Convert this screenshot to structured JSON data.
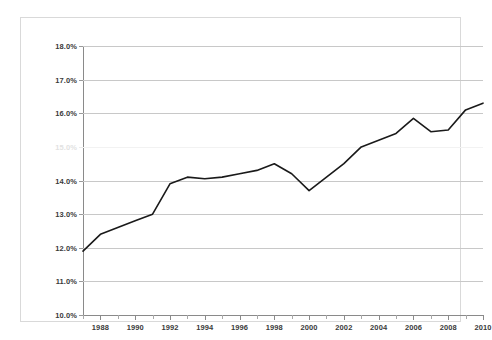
{
  "chart_data": {
    "type": "line",
    "title": "",
    "subtitle": "",
    "xlabel": "",
    "ylabel": "",
    "xlim": [
      1987,
      2010
    ],
    "ylim": [
      10.0,
      18.0
    ],
    "grid": true,
    "legend": false,
    "legend_position": "none",
    "y_tick_labels": [
      "18.0%",
      "17.0%",
      "16.0%",
      "15.0%",
      "14.0%",
      "13.0%",
      "12.0%",
      "11.0%",
      "10.0%"
    ],
    "y_ticks": [
      18.0,
      17.0,
      16.0,
      15.0,
      14.0,
      13.0,
      12.0,
      11.0,
      10.0
    ],
    "y_tick_faded": [
      false,
      false,
      false,
      true,
      false,
      false,
      false,
      false,
      false
    ],
    "x_tick_labels": [
      "1988",
      "1990",
      "1992",
      "1994",
      "1996",
      "1998",
      "2000",
      "2002",
      "2004",
      "2006",
      "2008",
      "2010"
    ],
    "x_ticks_major": [
      1988,
      1990,
      1992,
      1994,
      1996,
      1998,
      2000,
      2002,
      2004,
      2006,
      2008,
      2010
    ],
    "x_ticks_minor": [
      1987,
      1989,
      1991,
      1993,
      1995,
      1997,
      1999,
      2001,
      2003,
      2005,
      2007,
      2009
    ],
    "series": [
      {
        "name": "",
        "color": "#1a1a1a",
        "x": [
          1987,
          1988,
          1989,
          1990,
          1991,
          1992,
          1993,
          1994,
          1995,
          1996,
          1997,
          1998,
          1999,
          2000,
          2001,
          2002,
          2003,
          2004,
          2005,
          2006,
          2007,
          2008,
          2009,
          2010
        ],
        "values": [
          11.9,
          12.4,
          12.6,
          12.8,
          13.0,
          13.9,
          14.1,
          14.05,
          14.1,
          14.2,
          14.3,
          14.5,
          14.2,
          13.7,
          14.1,
          14.5,
          15.0,
          15.2,
          15.4,
          15.85,
          15.45,
          15.5,
          16.1,
          16.3
        ]
      }
    ]
  }
}
